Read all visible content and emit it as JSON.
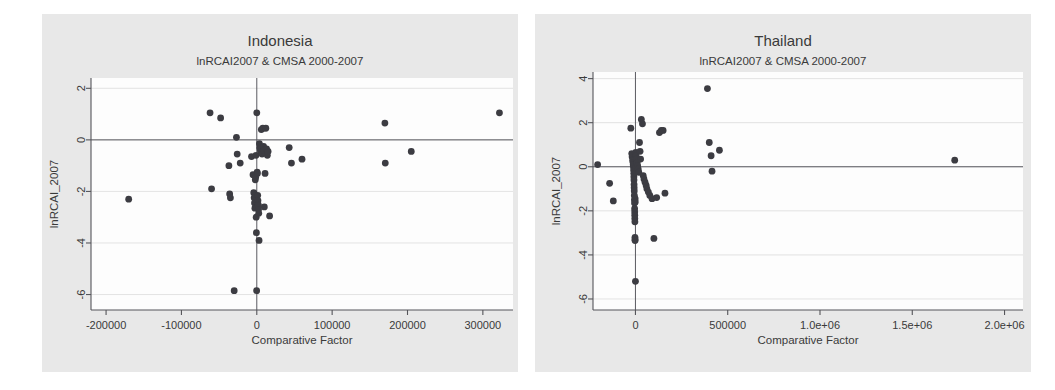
{
  "figure": {
    "background_color": "#ffffff",
    "panel_color": "#e8e8e8",
    "plot_color": "#fdfdfd",
    "marker_color": "#3c3c42"
  },
  "chart_data": [
    {
      "type": "scatter",
      "panel_name": "indonesia",
      "title": "Indonesia",
      "subtitle": "lnRCAI2007 & CMSA 2000-2007",
      "xlabel": "Comparative Factor",
      "ylabel": "lnRCAI_2007",
      "xlim": [
        -220000,
        340000
      ],
      "ylim": [
        -6.6,
        2.4
      ],
      "xticks": [
        -200000,
        -100000,
        0,
        100000,
        200000,
        300000
      ],
      "xticklabels": [
        "-200000",
        "-100000",
        "0",
        "100000",
        "200000",
        "300000"
      ],
      "yticks": [
        2,
        0,
        -2,
        -4,
        -6
      ],
      "yticklabels": [
        "2",
        "0",
        "-2",
        "-4",
        "-6"
      ],
      "grid": true,
      "reference_lines": {
        "horizontal_y": 0,
        "vertical_x": 0
      },
      "points": [
        [
          -170000,
          -2.3
        ],
        [
          -62000,
          1.05
        ],
        [
          -60000,
          -1.9
        ],
        [
          -48000,
          0.85
        ],
        [
          -37000,
          -1.0
        ],
        [
          -36000,
          -2.1
        ],
        [
          -35000,
          -2.25
        ],
        [
          -30000,
          -5.85
        ],
        [
          -27000,
          0.1
        ],
        [
          -26000,
          -0.55
        ],
        [
          -22000,
          -0.9
        ],
        [
          -7000,
          -0.65
        ],
        [
          -5000,
          -1.35
        ],
        [
          -4000,
          -2.05
        ],
        [
          -3500,
          -2.25
        ],
        [
          -3000,
          -2.45
        ],
        [
          -2500,
          -2.65
        ],
        [
          -2000,
          -1.55
        ],
        [
          -1500,
          -1.45
        ],
        [
          -1000,
          -0.6
        ],
        [
          -800,
          -3.0
        ],
        [
          -500,
          -3.6
        ],
        [
          -200,
          -5.85
        ],
        [
          0,
          1.05
        ],
        [
          500,
          -1.25
        ],
        [
          800,
          -1.3
        ],
        [
          1200,
          -2.15
        ],
        [
          1500,
          -2.35
        ],
        [
          1800,
          -2.5
        ],
        [
          2000,
          -2.55
        ],
        [
          2300,
          -2.7
        ],
        [
          2600,
          -2.85
        ],
        [
          3000,
          -3.9
        ],
        [
          3500,
          -0.15
        ],
        [
          4000,
          -0.3
        ],
        [
          4500,
          -0.35
        ],
        [
          5000,
          -0.45
        ],
        [
          6000,
          0.4
        ],
        [
          6500,
          -0.5
        ],
        [
          7000,
          -0.55
        ],
        [
          8000,
          0.45
        ],
        [
          9000,
          -0.25
        ],
        [
          9500,
          -0.4
        ],
        [
          10000,
          -2.6
        ],
        [
          11000,
          -1.3
        ],
        [
          12000,
          0.45
        ],
        [
          13000,
          -0.35
        ],
        [
          14000,
          -0.6
        ],
        [
          15000,
          -0.45
        ],
        [
          17000,
          -2.95
        ],
        [
          43000,
          -0.3
        ],
        [
          46000,
          -0.9
        ],
        [
          60000,
          -0.75
        ],
        [
          170000,
          0.65
        ],
        [
          170500,
          -0.9
        ],
        [
          205000,
          -0.45
        ],
        [
          322000,
          1.05
        ]
      ]
    },
    {
      "type": "scatter",
      "panel_name": "thailand",
      "title": "Thailand",
      "subtitle": "lnRCAI2007 & CMSA 2000-2007",
      "xlabel": "Comparative Factor",
      "ylabel": "lnRCAI_2007",
      "xlim": [
        -230000,
        2100000
      ],
      "ylim": [
        -6.5,
        4.3
      ],
      "xticks": [
        0,
        500000,
        1000000,
        1500000,
        2000000
      ],
      "xticklabels": [
        "0",
        "500000",
        "1.0e+06",
        "1.5e+06",
        "2.0e+06"
      ],
      "yticks": [
        4,
        2,
        0,
        -2,
        -4,
        -6
      ],
      "yticklabels": [
        "4",
        "2",
        "0",
        "-2",
        "-4",
        "-6"
      ],
      "grid": true,
      "reference_lines": {
        "horizontal_y": 0,
        "vertical_x": 0
      },
      "points": [
        [
          -205000,
          0.1
        ],
        [
          -140000,
          -0.75
        ],
        [
          -120000,
          -1.55
        ],
        [
          -25000,
          1.75
        ],
        [
          -20000,
          0.6
        ],
        [
          -18000,
          0.45
        ],
        [
          -15000,
          0.3
        ],
        [
          -13000,
          0.2
        ],
        [
          -12000,
          0.1
        ],
        [
          -11000,
          0.0
        ],
        [
          -10000,
          -0.15
        ],
        [
          -9000,
          -0.3
        ],
        [
          -8500,
          -0.45
        ],
        [
          -8000,
          -0.6
        ],
        [
          -7500,
          -0.8
        ],
        [
          -7000,
          -0.95
        ],
        [
          -6500,
          -1.1
        ],
        [
          -6000,
          -1.3
        ],
        [
          -5500,
          -1.5
        ],
        [
          -5000,
          -1.65
        ],
        [
          -4500,
          -1.9
        ],
        [
          -4000,
          -2.05
        ],
        [
          -3800,
          -2.2
        ],
        [
          -3500,
          -2.35
        ],
        [
          -3000,
          -2.5
        ],
        [
          -2500,
          -3.2
        ],
        [
          -2200,
          -3.3
        ],
        [
          -2000,
          -3.35
        ],
        [
          -1500,
          -1.45
        ],
        [
          -1000,
          -1.6
        ],
        [
          -500,
          -0.05
        ],
        [
          0,
          -5.2
        ],
        [
          2000,
          0.65
        ],
        [
          4000,
          0.5
        ],
        [
          6000,
          0.35
        ],
        [
          9000,
          0.2
        ],
        [
          12000,
          0.05
        ],
        [
          15000,
          -0.1
        ],
        [
          18000,
          -0.25
        ],
        [
          22000,
          1.1
        ],
        [
          25000,
          0.7
        ],
        [
          28000,
          0.35
        ],
        [
          32000,
          2.15
        ],
        [
          38000,
          1.95
        ],
        [
          42000,
          -0.4
        ],
        [
          46000,
          -0.55
        ],
        [
          52000,
          -0.7
        ],
        [
          58000,
          -0.85
        ],
        [
          62000,
          -1.0
        ],
        [
          70000,
          -1.15
        ],
        [
          78000,
          -1.3
        ],
        [
          90000,
          -1.45
        ],
        [
          100000,
          -3.25
        ],
        [
          115000,
          -1.4
        ],
        [
          130000,
          1.55
        ],
        [
          140000,
          1.65
        ],
        [
          150000,
          1.65
        ],
        [
          160000,
          -1.2
        ],
        [
          390000,
          3.55
        ],
        [
          400000,
          1.1
        ],
        [
          410000,
          0.5
        ],
        [
          415000,
          -0.2
        ],
        [
          455000,
          0.75
        ],
        [
          1730000,
          0.3
        ]
      ]
    }
  ]
}
